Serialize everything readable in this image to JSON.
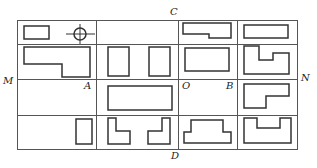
{
  "diagram": {
    "type": "grid-of-shape-views",
    "colors": {
      "grid": "#555555",
      "shape": "#333333",
      "background": "#ffffff"
    },
    "grid": {
      "left": 17,
      "top": 20,
      "right": 297,
      "bottom": 149,
      "columns_x": [
        17,
        96,
        178,
        237,
        297
      ],
      "rows_y": [
        20,
        44,
        79,
        115,
        149
      ]
    },
    "labels": {
      "C": "C",
      "D": "D",
      "M": "M",
      "N": "N",
      "A": "A",
      "O": "O",
      "B": "B"
    },
    "cells": [
      {
        "row": 0,
        "col": 0,
        "content": "small rectangle and circle with crosshair"
      },
      {
        "row": 0,
        "col": 1,
        "content": "empty"
      },
      {
        "row": 0,
        "col": 2,
        "content": "wide rectangle with notch at lower left"
      },
      {
        "row": 0,
        "col": 3,
        "content": "wide rectangle"
      },
      {
        "row": 1,
        "col": 0,
        "content": "L-shaped wide rectangle"
      },
      {
        "row": 1,
        "col": 1,
        "content": "two tall rectangles"
      },
      {
        "row": 1,
        "col": 2,
        "content": "rectangle"
      },
      {
        "row": 1,
        "col": 3,
        "content": "U-step shape with notch top"
      },
      {
        "row": 2,
        "col": 0,
        "content": "empty"
      },
      {
        "row": 2,
        "col": 1,
        "content": "wide rectangle"
      },
      {
        "row": 2,
        "col": 2,
        "content": "empty"
      },
      {
        "row": 2,
        "col": 3,
        "content": "L-shape stepped"
      },
      {
        "row": 3,
        "col": 0,
        "content": "tall narrow rectangle"
      },
      {
        "row": 3,
        "col": 1,
        "content": "two mirrored L-shapes"
      },
      {
        "row": 3,
        "col": 2,
        "content": "stepped trapezoid (T-inverted) shape"
      },
      {
        "row": 3,
        "col": 3,
        "content": "U-shape"
      }
    ]
  }
}
